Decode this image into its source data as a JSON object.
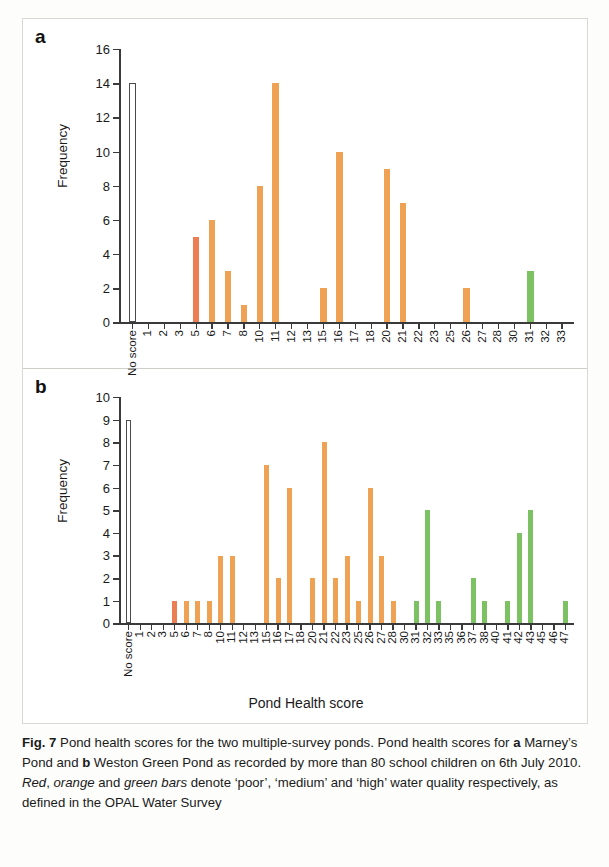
{
  "figure": {
    "label": "Fig. 7",
    "caption_parts": [
      {
        "text": "Fig. 7",
        "style": "bold"
      },
      {
        "text": " Pond health scores for the two multiple-survey ponds. Pond health scores for ",
        "style": "normal"
      },
      {
        "text": "a",
        "style": "bold"
      },
      {
        "text": " Marney’s Pond and ",
        "style": "normal"
      },
      {
        "text": "b",
        "style": "bold"
      },
      {
        "text": " Weston Green Pond as recorded by more than 80 school children on 6th July 2010. ",
        "style": "normal"
      },
      {
        "text": "Red",
        "style": "italic"
      },
      {
        "text": ", ",
        "style": "normal"
      },
      {
        "text": "orange",
        "style": "italic"
      },
      {
        "text": " and ",
        "style": "normal"
      },
      {
        "text": "green bars",
        "style": "italic"
      },
      {
        "text": " denote ‘poor’, ‘medium’ and ‘high’ water quality respectively, as defined in the OPAL Water Survey",
        "style": "normal"
      }
    ],
    "caption_plain": "Fig. 7 Pond health scores for the two multiple-survey ponds. Pond health scores for a Marney’s Pond and b Weston Green Pond as recorded by more than 80 school children on 6th July 2010. Red, orange and green bars denote ‘poor’, ‘medium’ and ‘high’ water quality respectively, as defined in the OPAL Water Survey"
  },
  "colors": {
    "poor": "#ed7d52",
    "medium": "#f0a254",
    "high": "#7cc263",
    "no_score": "#ffffff",
    "axis": "#3a3a3a"
  },
  "legend_semantics": {
    "poor": "Red bars – ‘poor’ water quality",
    "medium": "Orange bars – ‘medium’ water quality",
    "high": "Green bars – ‘high’ water quality"
  },
  "chart_data": [
    {
      "type": "bar",
      "panel": "a",
      "title": "Marney’s Pond",
      "xlabel": "",
      "ylabel": "Frequency",
      "ylim": [
        0,
        16
      ],
      "ytick_step": 2,
      "yticks": [
        0,
        2,
        4,
        6,
        8,
        10,
        12,
        14,
        16
      ],
      "grid": false,
      "legend": "none",
      "categories": [
        "No score",
        "1",
        "2",
        "3",
        "5",
        "6",
        "7",
        "8",
        "10",
        "11",
        "12",
        "13",
        "15",
        "16",
        "17",
        "18",
        "20",
        "21",
        "22",
        "23",
        "25",
        "26",
        "27",
        "28",
        "30",
        "31",
        "32",
        "33"
      ],
      "values": [
        14,
        0,
        0,
        0,
        5,
        6,
        3,
        1,
        8,
        14,
        0,
        0,
        2,
        10,
        0,
        0,
        9,
        7,
        0,
        0,
        0,
        2,
        0,
        0,
        0,
        3,
        0,
        0
      ],
      "bar_classes": [
        "none",
        "medium",
        "medium",
        "medium",
        "poor",
        "medium",
        "medium",
        "medium",
        "medium",
        "medium",
        "medium",
        "medium",
        "medium",
        "medium",
        "medium",
        "medium",
        "medium",
        "medium",
        "medium",
        "medium",
        "medium",
        "medium",
        "medium",
        "medium",
        "medium",
        "high",
        "high",
        "high"
      ]
    },
    {
      "type": "bar",
      "panel": "b",
      "title": "Weston Green Pond",
      "xlabel": "Pond Health score",
      "ylabel": "Frequency",
      "ylim": [
        0,
        10
      ],
      "ytick_step": 1,
      "yticks": [
        0,
        1,
        2,
        3,
        4,
        5,
        6,
        7,
        8,
        9,
        10
      ],
      "grid": false,
      "legend": "none",
      "categories": [
        "No score",
        "1",
        "2",
        "3",
        "5",
        "6",
        "7",
        "8",
        "10",
        "11",
        "12",
        "13",
        "15",
        "16",
        "17",
        "18",
        "20",
        "21",
        "22",
        "23",
        "25",
        "26",
        "27",
        "28",
        "30",
        "31",
        "32",
        "33",
        "35",
        "36",
        "37",
        "38",
        "40",
        "41",
        "42",
        "43",
        "45",
        "46",
        "47"
      ],
      "values": [
        9,
        0,
        0,
        0,
        1,
        1,
        1,
        1,
        3,
        3,
        0,
        0,
        7,
        2,
        6,
        0,
        2,
        8,
        2,
        3,
        1,
        6,
        3,
        1,
        0,
        1,
        5,
        1,
        0,
        0,
        2,
        1,
        0,
        1,
        4,
        5,
        0,
        0,
        1
      ],
      "bar_classes": [
        "none",
        "medium",
        "medium",
        "medium",
        "poor",
        "medium",
        "medium",
        "medium",
        "medium",
        "medium",
        "medium",
        "medium",
        "medium",
        "medium",
        "medium",
        "medium",
        "medium",
        "medium",
        "medium",
        "medium",
        "medium",
        "medium",
        "medium",
        "medium",
        "medium",
        "high",
        "high",
        "high",
        "high",
        "high",
        "high",
        "high",
        "high",
        "high",
        "high",
        "high",
        "high",
        "high",
        "high"
      ]
    }
  ]
}
